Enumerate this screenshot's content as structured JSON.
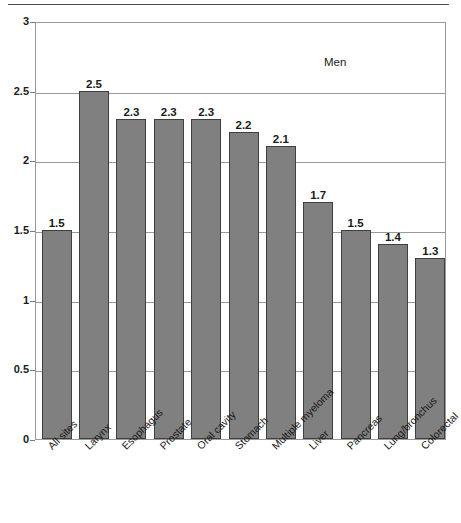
{
  "chart_data": {
    "type": "bar",
    "title": "",
    "subtitle": "",
    "annotation": "Men",
    "xlabel": "",
    "ylabel": "",
    "ylim": [
      0,
      3
    ],
    "ytick_labels": [
      "0",
      "0.5",
      "1",
      "1.5",
      "2",
      "2.5",
      "3"
    ],
    "ytick_values": [
      0,
      0.5,
      1,
      1.5,
      2,
      2.5,
      3
    ],
    "grid": true,
    "legend_position": "none",
    "bar_color": "#808080",
    "bar_edge_color": "#3f3f3f",
    "grid_color": "#9a9a9a",
    "categories": [
      "All sites",
      "Larynx",
      "Esophagus",
      "Prostate",
      "Oral cavity",
      "Stomach",
      "Multiple myeloma",
      "Liver",
      "Pancreas",
      "Lung/bronchus",
      "Colorectal"
    ],
    "values": [
      1.5,
      2.5,
      2.3,
      2.3,
      2.3,
      2.2,
      2.1,
      1.7,
      1.5,
      1.4,
      1.3
    ],
    "value_labels": [
      "1.5",
      "2.5",
      "2.3",
      "2.3",
      "2.3",
      "2.2",
      "2.1",
      "1.7",
      "1.5",
      "1.4",
      "1.3"
    ]
  }
}
